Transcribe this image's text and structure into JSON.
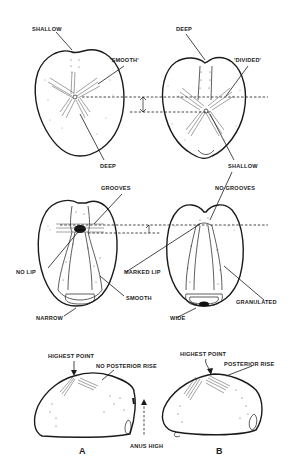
{
  "figure": {
    "top_row": {
      "left": {
        "labels": {
          "anterior_groove": "SHALLOW",
          "petals": "'SMOOTH'",
          "posterior_petals": "DEEP"
        }
      },
      "right": {
        "labels": {
          "anterior_groove": "DEEP",
          "petals": "'DIVIDED'",
          "posterior_petals": "SHALLOW"
        }
      }
    },
    "middle_row": {
      "left": {
        "labels": {
          "peristome_region": "GROOVES",
          "lip": "NO LIP",
          "plastron": "SMOOTH",
          "periproct_band": "NARROW"
        }
      },
      "right": {
        "labels": {
          "peristome_region": "NO GROOVES",
          "lip": "MARKED LIP",
          "plastron": "GRANULATED",
          "periproct_band": "WIDE"
        }
      }
    },
    "bottom_row": {
      "left": {
        "letter": "A",
        "labels": {
          "apex": "HIGHEST POINT",
          "posterior": "NO POSTERIOR RISE",
          "anus": "ANUS HIGH"
        }
      },
      "right": {
        "letter": "B",
        "labels": {
          "apex": "HIGHEST POINT",
          "posterior": "POSTERIOR RISE"
        }
      }
    }
  },
  "colors": {
    "ink": "#1a1a1a",
    "background": "#ffffff"
  }
}
